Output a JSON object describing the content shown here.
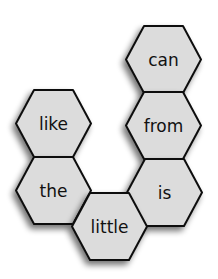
{
  "colors": {
    "hex_fill": "#dcdcdc",
    "hex_stroke": "#111111",
    "shadow": "#888888",
    "background": "#ffffff"
  },
  "hexagons": [
    {
      "id": "can",
      "label": "can",
      "x": 126,
      "y": 26
    },
    {
      "id": "from",
      "label": "from",
      "x": 126,
      "y": 92
    },
    {
      "id": "like",
      "label": "like",
      "x": 16,
      "y": 90
    },
    {
      "id": "the",
      "label": "the",
      "x": 16,
      "y": 157
    },
    {
      "id": "is",
      "label": "is",
      "x": 127,
      "y": 159
    },
    {
      "id": "little",
      "label": "little",
      "x": 72,
      "y": 193
    }
  ]
}
